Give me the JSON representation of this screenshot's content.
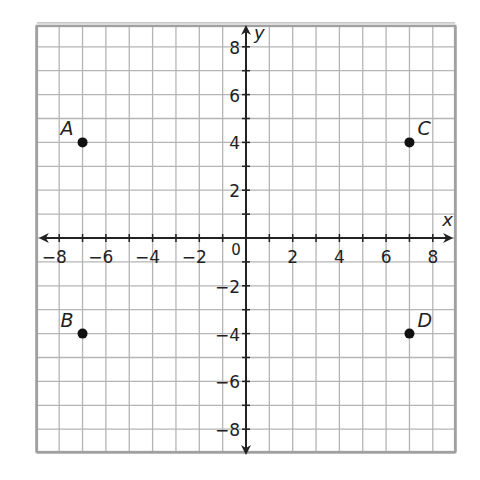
{
  "chart_data": {
    "type": "scatter",
    "title": "",
    "xlabel": "x",
    "ylabel": "y",
    "xlim": [
      -9,
      9
    ],
    "ylim": [
      -9,
      9
    ],
    "grid": true,
    "x_ticks": [
      -8,
      -6,
      -4,
      -2,
      2,
      4,
      6,
      8
    ],
    "y_ticks": [
      8,
      6,
      4,
      2,
      -2,
      -4,
      -6,
      -8
    ],
    "origin_label": "0",
    "points": [
      {
        "label": "A",
        "x": -7,
        "y": 4
      },
      {
        "label": "B",
        "x": -7,
        "y": -4
      },
      {
        "label": "C",
        "x": 7,
        "y": 4
      },
      {
        "label": "D",
        "x": 7,
        "y": -4
      }
    ]
  },
  "colors": {
    "grid": "#b5b5b5",
    "border": "#a0a0a0",
    "axis": "#222222",
    "point": "#111111"
  }
}
